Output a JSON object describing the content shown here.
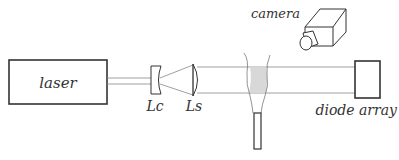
{
  "diagram": {
    "type": "optical-setup",
    "components": {
      "laser": {
        "label": "laser"
      },
      "cylindrical_lens": {
        "label": "Lc"
      },
      "spherical_lens": {
        "label": "Ls"
      },
      "camera": {
        "label": "camera"
      },
      "diode_array": {
        "label": "diode array"
      },
      "flame": {
        "label": ""
      },
      "burner": {
        "label": ""
      }
    },
    "colors": {
      "stroke": "#333333",
      "beam": "#888888",
      "flame_fill": "#d8d8d8"
    }
  }
}
